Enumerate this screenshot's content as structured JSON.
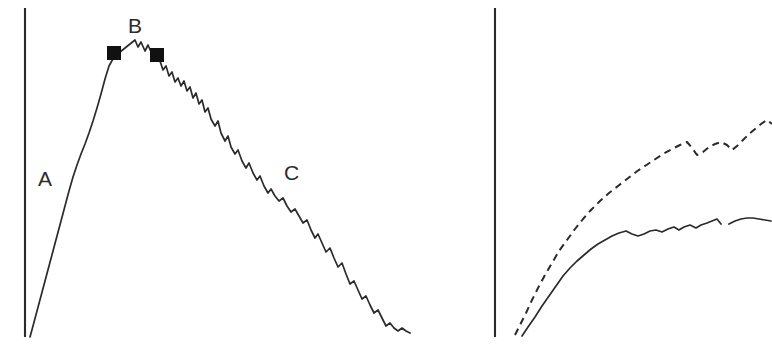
{
  "figure": {
    "width": 772,
    "height": 354,
    "background_color": "#ffffff",
    "ink_color": "#2b2b2b",
    "marker_color": "#111111"
  },
  "panels": [
    {
      "id": "left-panel",
      "axis": {
        "name": "y-axis",
        "x": 25,
        "y_top": 8,
        "y_bottom": 337
      },
      "labels": [
        {
          "name": "phase-label-a",
          "text": "A",
          "x": 38,
          "y": 168
        },
        {
          "name": "phase-label-b",
          "text": "B",
          "x": 128,
          "y": 15
        },
        {
          "name": "phase-label-c",
          "text": "C",
          "x": 284,
          "y": 162
        }
      ],
      "markers": [
        {
          "name": "marker-b-start",
          "cx": 114,
          "cy": 53,
          "size": 13
        },
        {
          "name": "marker-b-end",
          "cx": 157,
          "cy": 55,
          "size": 13
        }
      ]
    },
    {
      "id": "right-panel",
      "axis": {
        "name": "y-axis",
        "x": 55,
        "y_top": 8,
        "y_bottom": 337
      },
      "labels": [],
      "markers": []
    }
  ],
  "chart_data": [
    {
      "id": "left-panel-chart",
      "type": "line",
      "title": "",
      "xlabel": "",
      "ylabel": "",
      "grid": false,
      "legend": "none",
      "axis_style": "y-axis only, no ticks, no tick labels",
      "annotations": [
        {
          "label": "A",
          "meaning": "rising limb",
          "x": 38,
          "y": 178
        },
        {
          "label": "B",
          "meaning": "plateau / peak between markers",
          "x": 134,
          "y": 26
        },
        {
          "label": "C",
          "meaning": "descending limb",
          "x": 291,
          "y": 173
        }
      ],
      "series": [
        {
          "name": "main-curve",
          "style": "solid",
          "points": [
            [
              30,
              337
            ],
            [
              33,
              326
            ],
            [
              37,
              311
            ],
            [
              41,
              296
            ],
            [
              45,
              281
            ],
            [
              49,
              266
            ],
            [
              53,
              251
            ],
            [
              57,
              236
            ],
            [
              61,
              221
            ],
            [
              65,
              206
            ],
            [
              69,
              191
            ],
            [
              73,
              177
            ],
            [
              77,
              165
            ],
            [
              81,
              154
            ],
            [
              85,
              144
            ],
            [
              89,
              133
            ],
            [
              93,
              121
            ],
            [
              97,
              108
            ],
            [
              101,
              94
            ],
            [
              105,
              79
            ],
            [
              109,
              66
            ],
            [
              114,
              57
            ],
            [
              120,
              52
            ],
            [
              125,
              48
            ],
            [
              130,
              44
            ],
            [
              135,
              40
            ],
            [
              138,
              47
            ],
            [
              141,
              42
            ],
            [
              145,
              51
            ],
            [
              148,
              45
            ],
            [
              152,
              54
            ],
            [
              157,
              57
            ],
            [
              160,
              61
            ],
            [
              163,
              70
            ],
            [
              166,
              66
            ],
            [
              169,
              76
            ],
            [
              172,
              72
            ],
            [
              175,
              82
            ],
            [
              178,
              78
            ],
            [
              181,
              86
            ],
            [
              184,
              81
            ],
            [
              187,
              91
            ],
            [
              190,
              87
            ],
            [
              193,
              98
            ],
            [
              196,
              93
            ],
            [
              199,
              104
            ],
            [
              202,
              100
            ],
            [
              205,
              112
            ],
            [
              208,
              108
            ],
            [
              211,
              119
            ],
            [
              215,
              126
            ],
            [
              218,
              121
            ],
            [
              221,
              133
            ],
            [
              225,
              141
            ],
            [
              228,
              136
            ],
            [
              231,
              147
            ],
            [
              235,
              154
            ],
            [
              238,
              150
            ],
            [
              242,
              161
            ],
            [
              246,
              168
            ],
            [
              249,
              163
            ],
            [
              253,
              173
            ],
            [
              257,
              180
            ],
            [
              260,
              176
            ],
            [
              264,
              186
            ],
            [
              268,
              193
            ],
            [
              271,
              189
            ],
            [
              275,
              196
            ],
            [
              279,
              201
            ],
            [
              283,
              198
            ],
            [
              287,
              206
            ],
            [
              291,
              212
            ],
            [
              295,
              209
            ],
            [
              299,
              216
            ],
            [
              303,
              223
            ],
            [
              307,
              220
            ],
            [
              311,
              230
            ],
            [
              315,
              238
            ],
            [
              318,
              234
            ],
            [
              322,
              243
            ],
            [
              326,
              252
            ],
            [
              330,
              248
            ],
            [
              334,
              258
            ],
            [
              338,
              267
            ],
            [
              342,
              263
            ],
            [
              346,
              274
            ],
            [
              350,
              284
            ],
            [
              354,
              281
            ],
            [
              358,
              290
            ],
            [
              362,
              299
            ],
            [
              366,
              296
            ],
            [
              370,
              305
            ],
            [
              374,
              313
            ],
            [
              378,
              310
            ],
            [
              382,
              318
            ],
            [
              386,
              326
            ],
            [
              390,
              323
            ],
            [
              394,
              328
            ],
            [
              398,
              331
            ],
            [
              402,
              328
            ],
            [
              406,
              331
            ],
            [
              410,
              333
            ]
          ]
        }
      ]
    },
    {
      "id": "right-panel-chart",
      "type": "line",
      "title": "",
      "xlabel": "",
      "ylabel": "",
      "grid": false,
      "legend": "none",
      "axis_style": "y-axis only, no ticks, no tick labels",
      "series": [
        {
          "name": "upper-curve",
          "style": "dashed",
          "points": [
            [
              75,
              335
            ],
            [
              80,
              325
            ],
            [
              86,
              313
            ],
            [
              92,
              300
            ],
            [
              98,
              288
            ],
            [
              105,
              275
            ],
            [
              112,
              263
            ],
            [
              119,
              251
            ],
            [
              127,
              240
            ],
            [
              135,
              229
            ],
            [
              143,
              219
            ],
            [
              151,
              210
            ],
            [
              160,
              201
            ],
            [
              169,
              193
            ],
            [
              178,
              186
            ],
            [
              187,
              179
            ],
            [
              196,
              172
            ],
            [
              205,
              166
            ],
            [
              214,
              160
            ],
            [
              223,
              154
            ],
            [
              232,
              149
            ],
            [
              240,
              145
            ],
            [
              247,
              142
            ],
            [
              252,
              148
            ],
            [
              257,
              155
            ],
            [
              263,
              152
            ],
            [
              269,
              147
            ],
            [
              275,
              144
            ],
            [
              281,
              142
            ],
            [
              287,
              145
            ],
            [
              292,
              150
            ],
            [
              297,
              146
            ],
            [
              303,
              140
            ],
            [
              309,
              134
            ],
            [
              315,
              129
            ],
            [
              321,
              124
            ],
            [
              327,
              120
            ],
            [
              332,
              124
            ]
          ]
        },
        {
          "name": "lower-curve",
          "style": "solid",
          "points": [
            [
              82,
              336
            ],
            [
              88,
              327
            ],
            [
              95,
              317
            ],
            [
              102,
              306
            ],
            [
              109,
              296
            ],
            [
              116,
              286
            ],
            [
              123,
              276
            ],
            [
              130,
              268
            ],
            [
              137,
              261
            ],
            [
              144,
              255
            ],
            [
              151,
              249
            ],
            [
              158,
              244
            ],
            [
              165,
              240
            ],
            [
              172,
              236
            ],
            [
              179,
              233
            ],
            [
              186,
              231
            ],
            [
              192,
              234
            ],
            [
              198,
              236
            ],
            [
              204,
              234
            ],
            [
              210,
              231
            ],
            [
              216,
              230
            ],
            [
              222,
              232
            ],
            [
              228,
              229
            ],
            [
              234,
              227
            ],
            [
              239,
              230
            ],
            [
              244,
              227
            ],
            [
              250,
              225
            ],
            [
              256,
              228
            ],
            [
              261,
              225
            ],
            [
              267,
              223
            ],
            [
              272,
              221
            ],
            [
              277,
              219
            ],
            [
              281,
              224
            ]
          ]
        },
        {
          "name": "lower-curve-segment-2",
          "style": "solid",
          "points": [
            [
              289,
              224
            ],
            [
              295,
              221
            ],
            [
              301,
              219
            ],
            [
              307,
              218
            ],
            [
              313,
              218
            ],
            [
              319,
              219
            ],
            [
              325,
              220
            ],
            [
              331,
              221
            ]
          ]
        }
      ]
    }
  ]
}
